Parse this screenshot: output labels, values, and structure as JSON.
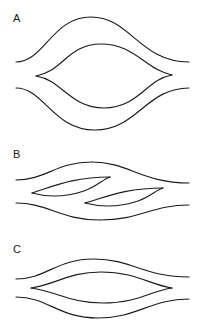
{
  "figure": {
    "background_color": "#ffffff",
    "stroke_color": "#1c1c1c",
    "width": 203,
    "height": 330,
    "panel_count": 3
  },
  "panels": [
    {
      "id": "A",
      "label": "A",
      "label_x": 13,
      "label_y": 13,
      "description": "Symmetric lens (eye) interference pattern with strongly arched outer envelope curves",
      "lens": {
        "left_tip": [
          36,
          76
        ],
        "right_tip": [
          172,
          75
        ],
        "upper_apex_y": 44,
        "lower_apex_y": 108,
        "amplitude": 32
      },
      "curve_count": 4
    },
    {
      "id": "B",
      "label": "B",
      "label_x": 13,
      "label_y": 149,
      "description": "Two sheared, en-echelon offset lens shapes between gently S-curved envelopes",
      "lenses": [
        {
          "left_tip": [
            32,
            193
          ],
          "right_tip": [
            110,
            177
          ]
        },
        {
          "left_tip": [
            85,
            203
          ],
          "right_tip": [
            163,
            188
          ]
        }
      ],
      "curve_count": 4
    },
    {
      "id": "C",
      "label": "C",
      "label_x": 13,
      "label_y": 244,
      "description": "Flattened wide symmetric lens with shallow outer envelope curves",
      "lens": {
        "left_tip": [
          31,
          288
        ],
        "right_tip": [
          172,
          288
        ],
        "upper_apex_y": 272,
        "lower_apex_y": 303,
        "amplitude": 16
      },
      "curve_count": 4
    }
  ],
  "chart_data": {
    "type": "line",
    "xlabel": "",
    "ylabel": "",
    "grid": false,
    "legend": "none",
    "xlim": [
      0,
      203
    ],
    "ylim": [
      0,
      330
    ],
    "series": [
      {
        "name": "A-outer-upper",
        "panel": "A",
        "path": "M 16 62 C 44 62, 52 17, 91 17 C 130 17, 140 62, 189 62"
      },
      {
        "name": "A-lens-upper",
        "panel": "A",
        "path": "M 36 76 C 62 72, 68 44, 101 44 C 135 44, 146 70, 172 75"
      },
      {
        "name": "A-lens-lower",
        "panel": "A",
        "path": "M 36 76 C 62 80, 70 108, 104 108 C 138 108, 147 79, 172 75"
      },
      {
        "name": "A-outer-lower",
        "panel": "A",
        "path": "M 16 88 C 44 88, 53 130, 95 130 C 137 130, 146 88, 189 88"
      },
      {
        "name": "B-outer-upper",
        "panel": "B",
        "path": "M 16 180 C 46 180, 56 162, 92 162 C 128 162, 142 183, 189 183"
      },
      {
        "name": "B-lens1-upper",
        "panel": "B",
        "path": "M 32 193 C 52 187, 72 177, 110 177"
      },
      {
        "name": "B-lens1-lower",
        "panel": "B",
        "path": "M 32 193 C 50 198, 66 197, 84 191 C 96 187, 102 180, 110 177"
      },
      {
        "name": "B-lens2-upper",
        "panel": "B",
        "path": "M 85 203 C 106 197, 125 188, 163 188"
      },
      {
        "name": "B-lens2-lower",
        "panel": "B",
        "path": "M 85 203 C 104 208, 120 207, 138 201 C 150 197, 156 190, 163 188"
      },
      {
        "name": "B-outer-lower",
        "panel": "B",
        "path": "M 16 203 C 48 203, 60 220, 100 220 C 140 220, 152 205, 189 205"
      },
      {
        "name": "C-outer-upper",
        "panel": "C",
        "path": "M 16 279 C 46 279, 56 259, 94 259 C 132 259, 144 277, 189 277"
      },
      {
        "name": "C-lens-upper",
        "panel": "C",
        "path": "M 31 288 C 58 284, 68 272, 101 272 C 136 272, 150 285, 172 288"
      },
      {
        "name": "C-lens-lower",
        "panel": "C",
        "path": "M 31 288 C 58 292, 70 303, 103 303 C 138 303, 150 291, 172 288"
      },
      {
        "name": "C-outer-lower",
        "panel": "C",
        "path": "M 16 297 C 48 297, 58 318, 98 318 C 138 318, 150 299, 189 299"
      }
    ]
  }
}
